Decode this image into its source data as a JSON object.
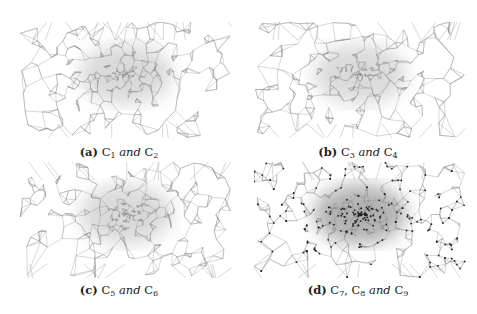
{
  "figure": {
    "panels": [
      {
        "id": "a",
        "label": "(a)",
        "sets": [
          "C",
          "1",
          "C",
          "2"
        ],
        "caption_mid": "and",
        "style": {
          "density": 0.55,
          "dots": false,
          "tone": "#777777"
        }
      },
      {
        "id": "b",
        "label": "(b)",
        "sets": [
          "C",
          "3",
          "C",
          "4"
        ],
        "caption_mid": "and",
        "style": {
          "density": 0.55,
          "dots": false,
          "tone": "#7a7a7a"
        }
      },
      {
        "id": "c",
        "label": "(c)",
        "sets": [
          "C",
          "5",
          "C",
          "6"
        ],
        "caption_mid": "and",
        "style": {
          "density": 0.6,
          "dots": false,
          "tone": "#777777"
        }
      },
      {
        "id": "d",
        "label": "(d)",
        "sets": [
          "C",
          "7",
          "C",
          "8",
          "C",
          "9"
        ],
        "caption_mid": "and",
        "style": {
          "density": 0.9,
          "dots": true,
          "tone": "#555555"
        }
      }
    ],
    "captions": {
      "a": {
        "label": "(a)",
        "c1": "C",
        "s1": "1",
        "mid": "and",
        "c2": "C",
        "s2": "2"
      },
      "b": {
        "label": "(b)",
        "c1": "C",
        "s1": "3",
        "mid": "and",
        "c2": "C",
        "s2": "4"
      },
      "c": {
        "label": "(c)",
        "c1": "C",
        "s1": "5",
        "mid": "and",
        "c2": "C",
        "s2": "6"
      },
      "d": {
        "label": "(d)",
        "c1": "C",
        "s1": "7",
        "sep": ",",
        "c2": "C",
        "s2": "8",
        "mid": "and",
        "c3": "C",
        "s3": "9"
      }
    }
  }
}
